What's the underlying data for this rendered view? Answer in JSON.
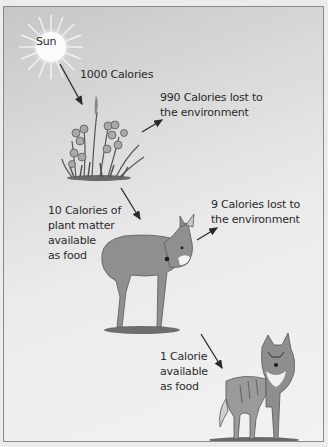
{
  "diagram": {
    "type": "energy-pyramid-food-chain",
    "nodes": [
      {
        "id": "sun",
        "label": "Sun"
      },
      {
        "id": "plants",
        "label": "plants"
      },
      {
        "id": "deer",
        "label": "deer"
      },
      {
        "id": "wolf",
        "label": "wolf"
      }
    ],
    "labels": {
      "sun": "Sun",
      "sun_to_plants": "1000 Calories",
      "plants_loss_line1": "990 Calories lost to",
      "plants_loss_line2": "the environment",
      "plants_to_deer_line1": "10 Calories of",
      "plants_to_deer_line2": "plant matter",
      "plants_to_deer_line3": "available",
      "plants_to_deer_line4": "as food",
      "deer_loss_line1": "9 Calories lost to",
      "deer_loss_line2": "the environment",
      "deer_to_wolf_line1": "1 Calorie",
      "deer_to_wolf_line2": "available",
      "deer_to_wolf_line3": "as food"
    },
    "edges": [
      {
        "from": "sun",
        "to": "plants",
        "label": "1000 Calories"
      },
      {
        "from": "plants",
        "to": "environment",
        "label": "990 Calories lost to the environment"
      },
      {
        "from": "plants",
        "to": "deer",
        "label": "10 Calories of plant matter available as food"
      },
      {
        "from": "deer",
        "to": "environment",
        "label": "9 Calories lost to the environment"
      },
      {
        "from": "deer",
        "to": "wolf",
        "label": "1 Calorie available as food"
      }
    ]
  }
}
